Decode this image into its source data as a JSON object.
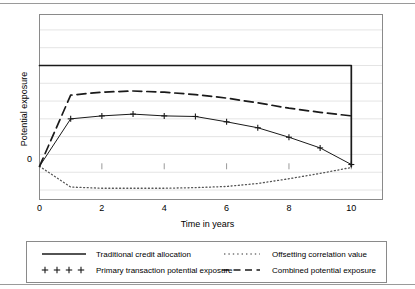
{
  "chart_data": {
    "type": "line",
    "title": "",
    "xlabel": "Time in years",
    "ylabel": "Potential exposure",
    "xlim": [
      0,
      11
    ],
    "ylim": [
      -0.28,
      1.28
    ],
    "xticks": [
      0,
      2,
      4,
      6,
      8,
      10
    ],
    "xticklabels": [
      "0",
      "2",
      "4",
      "6",
      "8",
      "10"
    ],
    "yticks": [
      0
    ],
    "yticklabels": [
      "0"
    ],
    "grid": "horizontal",
    "legend_position": "below-axes",
    "series": [
      {
        "name": "Traditional credit allocation",
        "style": "solid",
        "marker": "none",
        "x": [
          0,
          10,
          10
        ],
        "y": [
          0.85,
          0.85,
          0.0
        ]
      },
      {
        "name": "Offsetting correlation value",
        "style": "dotted",
        "marker": "none",
        "x": [
          0,
          1,
          2,
          3,
          4,
          5,
          6,
          7,
          8,
          9,
          10
        ],
        "y": [
          0.0,
          -0.175,
          -0.185,
          -0.185,
          -0.185,
          -0.18,
          -0.17,
          -0.145,
          -0.105,
          -0.06,
          -0.01
        ]
      },
      {
        "name": "Primary transaction potential exposure",
        "style": "solid",
        "marker": "plus",
        "x": [
          0,
          1,
          2,
          3,
          4,
          5,
          6,
          7,
          8,
          9,
          10
        ],
        "y": [
          0.0,
          0.4,
          0.425,
          0.44,
          0.425,
          0.42,
          0.375,
          0.325,
          0.245,
          0.155,
          0.015
        ]
      },
      {
        "name": "Combined potential exposure",
        "style": "dashed",
        "marker": "none",
        "x": [
          0,
          1,
          2,
          3,
          4,
          5,
          6,
          7,
          8,
          9,
          10
        ],
        "y": [
          0.0,
          0.6,
          0.625,
          0.635,
          0.625,
          0.605,
          0.575,
          0.535,
          0.49,
          0.455,
          0.425
        ]
      }
    ]
  },
  "axes": {
    "x_title": "Time in years",
    "y_title": "Potential exposure",
    "y_zero_label": "0",
    "xticklabels": [
      "0",
      "2",
      "4",
      "6",
      "8",
      "10"
    ]
  },
  "legend": {
    "entries": [
      {
        "label": "Traditional credit allocation",
        "swatch": "solid-line-swatch"
      },
      {
        "label": "Offsetting correlation value",
        "swatch": "dotted-line-swatch"
      },
      {
        "label": "Primary transaction potential exposure",
        "swatch": "plus-marker-swatch"
      },
      {
        "label": "Combined potential exposure",
        "swatch": "dashed-line-swatch"
      }
    ]
  },
  "colors": {
    "line": "#1a1a1a",
    "grid": "#e4e4e4",
    "frame": "#8a8a8a",
    "rule": "#9a9a9a",
    "background": "#ffffff"
  }
}
